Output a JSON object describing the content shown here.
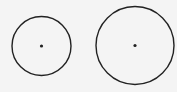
{
  "diagram": {
    "background": "#f4f4f4",
    "stroke_color": "#222222",
    "circles": [
      {
        "cx": 41.5,
        "cy": 46,
        "r": 29.5,
        "stroke_width": 1.4,
        "center_dot_r": 1.6
      },
      {
        "cx": 135,
        "cy": 45.5,
        "r": 39,
        "stroke_width": 1.4,
        "center_dot_r": 1.6
      }
    ]
  }
}
